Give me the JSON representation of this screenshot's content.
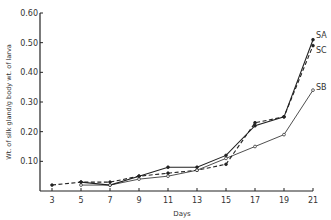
{
  "chart_data": {
    "type": "line",
    "title": "",
    "xlabel": "Days",
    "ylabel": "Wt. of silk gland/g body wt. of larva",
    "x": [
      3,
      5,
      7,
      9,
      11,
      13,
      15,
      17,
      19,
      21
    ],
    "xticks": [
      "3",
      "5",
      "7",
      "9",
      "11",
      "13",
      "15",
      "17",
      "19",
      "21"
    ],
    "yticks": [
      "0.10",
      "0.20",
      "0.30",
      "0.40",
      "0.50",
      "0.60"
    ],
    "ylim": [
      0,
      0.6
    ],
    "xlim": [
      3,
      21
    ],
    "grid": false,
    "legend_position": "inline-right",
    "series": [
      {
        "name": "SA",
        "style": "solid-filled-marker",
        "x": [
          5,
          7,
          9,
          11,
          13,
          15,
          17,
          19,
          21
        ],
        "values": [
          0.03,
          0.02,
          0.05,
          0.08,
          0.08,
          0.12,
          0.22,
          0.25,
          0.51
        ]
      },
      {
        "name": "SC",
        "style": "dashed",
        "x": [
          3,
          5,
          7,
          9,
          11,
          13,
          15,
          17,
          19,
          21
        ],
        "values": [
          0.02,
          0.03,
          0.03,
          0.05,
          0.06,
          0.07,
          0.09,
          0.23,
          0.25,
          0.49
        ]
      },
      {
        "name": "SB",
        "style": "solid-open-marker",
        "x": [
          5,
          7,
          9,
          11,
          13,
          15,
          17,
          19,
          21
        ],
        "values": [
          0.02,
          0.02,
          0.04,
          0.05,
          0.07,
          0.11,
          0.15,
          0.19,
          0.34
        ]
      }
    ]
  }
}
